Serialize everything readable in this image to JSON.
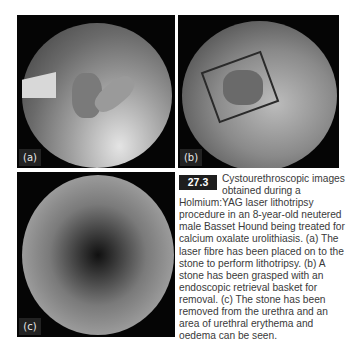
{
  "figure": {
    "number": "27.3",
    "panels": [
      {
        "label": "(a)",
        "description": "laser fibre placed on stone"
      },
      {
        "label": "(b)",
        "description": "stone grasped with retrieval basket"
      },
      {
        "label": "(c)",
        "description": "urethral erythema and oedema"
      }
    ],
    "caption": "Cystourethroscopic images obtained during a Holmium:YAG laser lithotripsy procedure in an 8-year-old neutered male Basset Hound being treated for calcium oxalate urolithiasis. (a) The laser fibre has been placed on to the stone to perform lithotripsy. (b) A stone has been grasped with an endoscopic retrieval basket for removal. (c) The stone has been removed from the urethra and an area of urethral erythema and oedema can be seen."
  }
}
